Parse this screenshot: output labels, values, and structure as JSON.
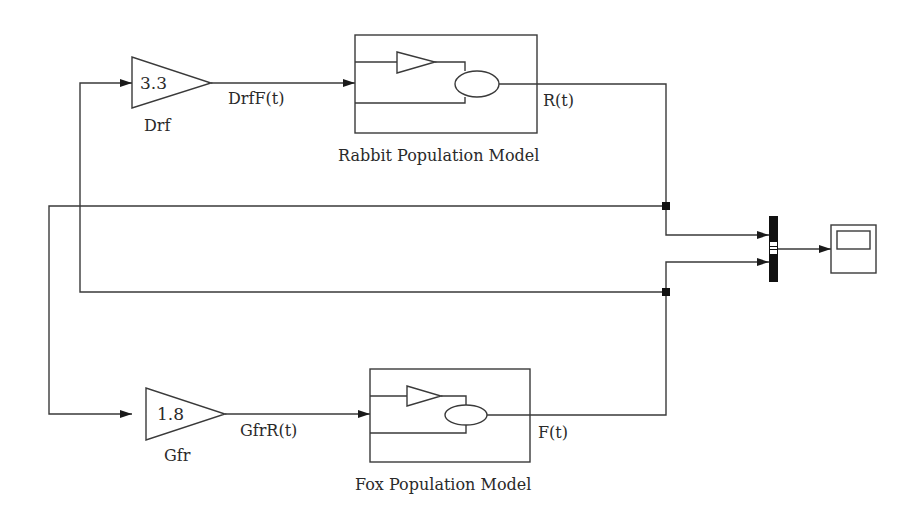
{
  "diagram": {
    "type": "simulink-block-diagram",
    "gains": [
      {
        "id": "drf",
        "name": "Drf",
        "value": "3.3",
        "output_signal": "DrfF(t)"
      },
      {
        "id": "gfr",
        "name": "Gfr",
        "value": "1.8",
        "output_signal": "GfrR(t)"
      }
    ],
    "subsystems": [
      {
        "id": "rabbit",
        "caption": "Rabbit Population Model",
        "output_signal": "R(t)"
      },
      {
        "id": "fox",
        "caption": "Fox Population Model",
        "output_signal": "F(t)"
      }
    ],
    "mux": {
      "name": "mux",
      "inputs": 2
    },
    "scope": {
      "name": "scope"
    },
    "colors": {
      "line": "#3a3a3a",
      "block_fill": "#ffffff",
      "mux_fill": "#111111"
    }
  }
}
